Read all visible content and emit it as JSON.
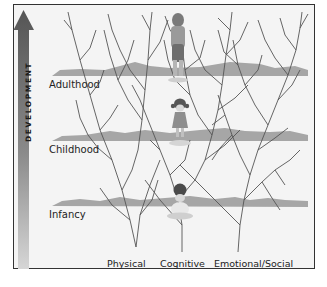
{
  "axis": {
    "label": "DEVELOPMENT"
  },
  "stages": [
    {
      "label": "Adulthood",
      "ground_y": 72
    },
    {
      "label": "Childhood",
      "ground_y": 137
    },
    {
      "label": "Infancy",
      "ground_y": 203
    }
  ],
  "domains": [
    {
      "label": "Physical"
    },
    {
      "label": "Cognitive"
    },
    {
      "label": "Emotional/Social"
    }
  ],
  "colors": {
    "frame": "#333333",
    "background": "#f4f4f4",
    "ground": "#a9a9a9",
    "branches": "#555555",
    "arrow_top": "#5a5a5a",
    "arrow_bottom": "#cfcfcf"
  }
}
